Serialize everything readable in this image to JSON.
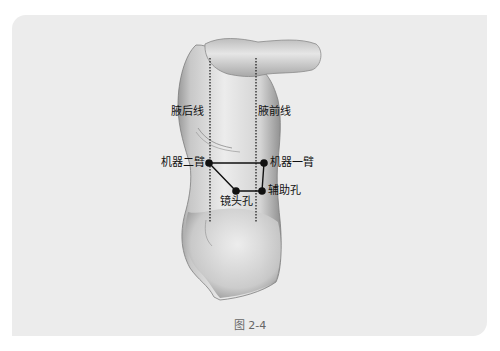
{
  "figure": {
    "caption": "图 2-4",
    "lines": {
      "posterior_axillary": "腋后线",
      "anterior_axillary": "腋前线"
    },
    "ports": [
      {
        "id": "robot-arm-2",
        "label": "机器二臂",
        "x": 209,
        "y": 163
      },
      {
        "id": "robot-arm-1",
        "label": "机器一臂",
        "x": 264,
        "y": 163
      },
      {
        "id": "camera-port",
        "label": "镜头孔",
        "x": 236,
        "y": 191
      },
      {
        "id": "assistant-port",
        "label": "辅助孔",
        "x": 262,
        "y": 191
      }
    ],
    "colors": {
      "background": "#ececec",
      "marker": "#111111",
      "dotted_line": "#222222",
      "skin_light": "#e8e8e8",
      "skin_dark": "#8a8a8a"
    }
  }
}
